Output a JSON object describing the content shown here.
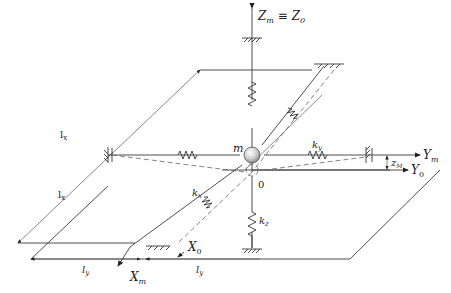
{
  "diagram": {
    "type": "mechanical-schematic",
    "mass_label": "m",
    "origin_label": "0",
    "axes": {
      "z": {
        "label_main": "Z",
        "sub_main": "m",
        "equiv": "≡",
        "label_ref": "Z",
        "sub_ref": "0"
      },
      "y_m": {
        "label": "Y",
        "sub": "m"
      },
      "y_0": {
        "label": "Y",
        "sub": "0"
      },
      "x_m": {
        "label": "X",
        "sub": "m"
      },
      "x_0": {
        "label": "X",
        "sub": "0"
      }
    },
    "springs": {
      "k_x": {
        "label": "k",
        "sub": "x"
      },
      "k_y": {
        "label": "k",
        "sub": "y"
      },
      "k_z": {
        "label": "k",
        "sub": "z"
      },
      "k_x_upper": {
        "label": "k",
        "sub": "x"
      }
    },
    "dimensions": {
      "l_x_top": {
        "label": "l",
        "sub": "x"
      },
      "l_x_left": {
        "label": "l",
        "sub": "x"
      },
      "l_y_left": {
        "label": "l",
        "sub": "y"
      },
      "l_y_right": {
        "label": "l",
        "sub": "y"
      },
      "z_m": {
        "label": "z",
        "sub": "M"
      }
    },
    "colors": {
      "line": "#3a3a3a",
      "mass_fill": "#d9d9d9",
      "background": "#ffffff"
    }
  }
}
